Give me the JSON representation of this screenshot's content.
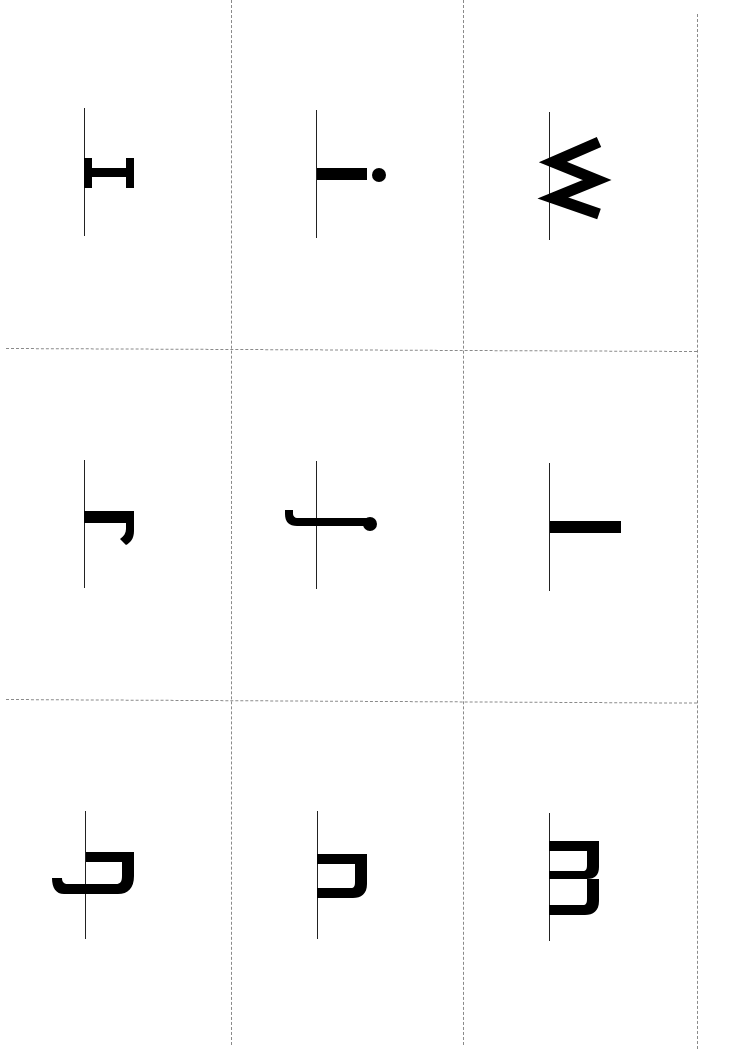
{
  "sheet": {
    "title": "Lowercase letter flashcards (rotated)",
    "rows": 3,
    "columns": 3,
    "cut_line_color": "#8a8a8a",
    "baseline_color": "#222222",
    "glyph_color": "#000000"
  },
  "cards": [
    {
      "row": 1,
      "col": 1,
      "letter": "I",
      "glyph": "serif-capital-i"
    },
    {
      "row": 1,
      "col": 2,
      "letter": "i",
      "glyph": "lowercase-i"
    },
    {
      "row": 1,
      "col": 3,
      "letter": "w",
      "glyph": "lowercase-w"
    },
    {
      "row": 2,
      "col": 1,
      "letter": "r",
      "glyph": "lowercase-r"
    },
    {
      "row": 2,
      "col": 2,
      "letter": "j",
      "glyph": "lowercase-j"
    },
    {
      "row": 2,
      "col": 3,
      "letter": "l",
      "glyph": "lowercase-l"
    },
    {
      "row": 3,
      "col": 1,
      "letter": "f",
      "glyph": "lowercase-f"
    },
    {
      "row": 3,
      "col": 2,
      "letter": "n",
      "glyph": "lowercase-n"
    },
    {
      "row": 3,
      "col": 3,
      "letter": "m",
      "glyph": "lowercase-m"
    }
  ]
}
